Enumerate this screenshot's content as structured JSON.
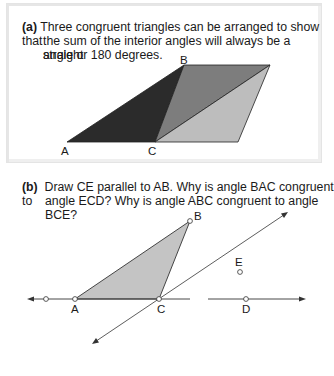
{
  "panel_a": {
    "tag": "(a)",
    "text_line1": "Three congruent triangles can be arranged to show that",
    "text_line2": "the sum of the interior angles will always be a straight",
    "text_line3": "angle or 180 degrees.",
    "labels": {
      "A": "A",
      "B": "B",
      "C": "C"
    },
    "colors": {
      "left_triangle": "#2b2b2b",
      "middle_triangle": "#7d7d7d",
      "right_triangle": "#bdbdbd"
    }
  },
  "panel_b": {
    "tag": "(b)",
    "text_line1": "Draw CE parallel to AB. Why is angle BAC congruent to",
    "text_line2": "angle ECD? Why is angle ABC congruent to angle BCE?",
    "labels": {
      "A": "A",
      "B": "B",
      "C": "C",
      "D": "D",
      "E": "E"
    },
    "colors": {
      "triangle_fill": "#c4c4c4"
    }
  }
}
